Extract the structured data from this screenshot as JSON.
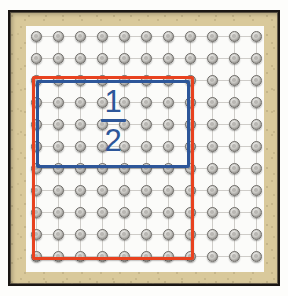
{
  "figure": {
    "label": {
      "numerator": "1",
      "denominator": "2",
      "text": "1/2",
      "color": "#2d5699"
    },
    "frame": {
      "border_color": "#1a1613",
      "mat_color": "#d9c99b",
      "board_color": "#fbfbf9"
    },
    "grid": {
      "columns": 11,
      "rows": 11,
      "spacing_px": 22,
      "peg_color": "#9a9894",
      "peg_outline_color": "#6d6b67",
      "line_color": "#cfcdc9"
    },
    "bands": [
      {
        "name": "red-band",
        "color": "#e8421f",
        "col_start": 1,
        "col_end": 8,
        "row_start": 3,
        "row_end": 11,
        "cells_wide": 7,
        "cells_tall": 8
      },
      {
        "name": "blue-band",
        "color": "#2d5699",
        "col_start": 1,
        "col_end": 8,
        "row_start": 3,
        "row_end": 7,
        "cells_wide": 7,
        "cells_tall": 4
      }
    ]
  }
}
